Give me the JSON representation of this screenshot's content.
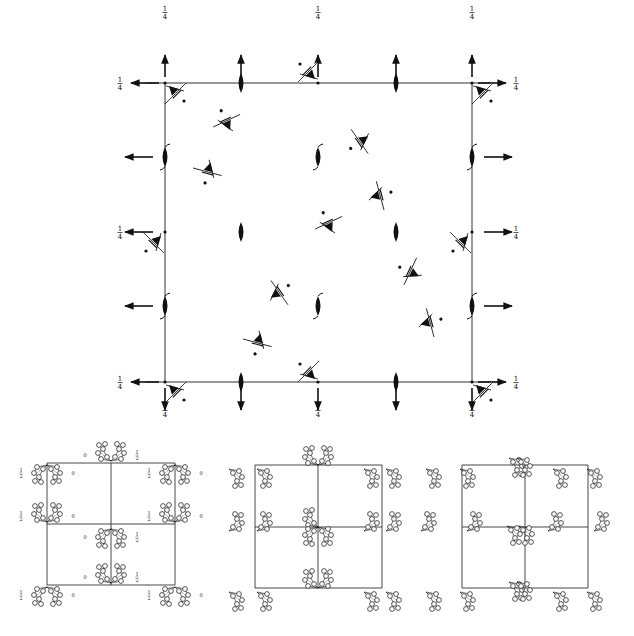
{
  "colors": {
    "ink": "#111111",
    "line": "#333333",
    "background": "#ffffff"
  },
  "main_panel": {
    "cell": {
      "x0": 165,
      "y0": 83,
      "x1": 472,
      "y1": 382,
      "xm": 318,
      "ym": 232
    },
    "fraction_label": "1/4",
    "edge_labels": [
      {
        "id": "top-left",
        "x": 165,
        "y": 12,
        "text": "1/4"
      },
      {
        "id": "top-mid",
        "x": 318,
        "y": 12,
        "text": "1/4"
      },
      {
        "id": "top-right",
        "x": 472,
        "y": 12,
        "text": "1/4"
      },
      {
        "id": "left-top",
        "x": 120,
        "y": 83,
        "text": "1/4"
      },
      {
        "id": "right-top",
        "x": 516,
        "y": 83,
        "text": "1/4"
      },
      {
        "id": "left-mid",
        "x": 120,
        "y": 232,
        "text": "1/4"
      },
      {
        "id": "right-mid",
        "x": 516,
        "y": 232,
        "text": "1/4"
      },
      {
        "id": "left-bottom",
        "x": 120,
        "y": 382,
        "text": "1/4"
      },
      {
        "id": "right-bottom",
        "x": 516,
        "y": 382,
        "text": "1/4"
      },
      {
        "id": "bottom-left",
        "x": 165,
        "y": 410,
        "text": "1/4"
      },
      {
        "id": "bottom-mid",
        "x": 318,
        "y": 410,
        "text": "1/4"
      },
      {
        "id": "bottom-right",
        "x": 472,
        "y": 410,
        "text": "1/4"
      }
    ],
    "twofold_axes": [
      {
        "x": 241,
        "y": 83,
        "kind": "plain"
      },
      {
        "x": 396,
        "y": 83,
        "kind": "plain"
      },
      {
        "x": 241,
        "y": 382,
        "kind": "plain"
      },
      {
        "x": 396,
        "y": 382,
        "kind": "plain"
      },
      {
        "x": 241,
        "y": 232,
        "kind": "plain"
      },
      {
        "x": 396,
        "y": 232,
        "kind": "plain"
      },
      {
        "x": 165,
        "y": 157,
        "kind": "screw"
      },
      {
        "x": 472,
        "y": 157,
        "kind": "screw"
      },
      {
        "x": 165,
        "y": 306,
        "kind": "screw"
      },
      {
        "x": 472,
        "y": 306,
        "kind": "screw"
      },
      {
        "x": 318,
        "y": 157,
        "kind": "screw"
      },
      {
        "x": 318,
        "y": 306,
        "kind": "screw"
      }
    ],
    "arrows": [
      {
        "x": 165,
        "y": 83,
        "dir": "up"
      },
      {
        "x": 165,
        "y": 83,
        "dir": "left"
      },
      {
        "x": 241,
        "y": 83,
        "dir": "up"
      },
      {
        "x": 318,
        "y": 83,
        "dir": "up"
      },
      {
        "x": 396,
        "y": 83,
        "dir": "up"
      },
      {
        "x": 472,
        "y": 83,
        "dir": "up"
      },
      {
        "x": 472,
        "y": 83,
        "dir": "right"
      },
      {
        "x": 165,
        "y": 157,
        "dir": "left"
      },
      {
        "x": 472,
        "y": 157,
        "dir": "right"
      },
      {
        "x": 165,
        "y": 232,
        "dir": "left"
      },
      {
        "x": 472,
        "y": 232,
        "dir": "right"
      },
      {
        "x": 165,
        "y": 306,
        "dir": "left"
      },
      {
        "x": 472,
        "y": 306,
        "dir": "right"
      },
      {
        "x": 165,
        "y": 382,
        "dir": "left"
      },
      {
        "x": 472,
        "y": 382,
        "dir": "right"
      },
      {
        "x": 165,
        "y": 382,
        "dir": "down"
      },
      {
        "x": 241,
        "y": 382,
        "dir": "down"
      },
      {
        "x": 318,
        "y": 382,
        "dir": "down"
      },
      {
        "x": 396,
        "y": 382,
        "dir": "down"
      },
      {
        "x": 472,
        "y": 382,
        "dir": "down"
      }
    ],
    "triads": [
      {
        "x": 176,
        "y": 93,
        "rot": 0
      },
      {
        "x": 483,
        "y": 93,
        "rot": 0
      },
      {
        "x": 308,
        "y": 72,
        "rot": 180
      },
      {
        "x": 176,
        "y": 392,
        "rot": 0
      },
      {
        "x": 483,
        "y": 392,
        "rot": 0
      },
      {
        "x": 308,
        "y": 372,
        "rot": 180
      },
      {
        "x": 154,
        "y": 243,
        "rot": 90
      },
      {
        "x": 461,
        "y": 243,
        "rot": 90
      },
      {
        "x": 226,
        "y": 121,
        "rot": 200
      },
      {
        "x": 208,
        "y": 172,
        "rot": 60
      },
      {
        "x": 360,
        "y": 142,
        "rot": 100
      },
      {
        "x": 380,
        "y": 195,
        "rot": 300
      },
      {
        "x": 328,
        "y": 223,
        "rot": 200
      },
      {
        "x": 410,
        "y": 272,
        "rot": 160
      },
      {
        "x": 279,
        "y": 292,
        "rot": 280
      },
      {
        "x": 258,
        "y": 343,
        "rot": 60
      },
      {
        "x": 430,
        "y": 322,
        "rot": 300
      }
    ]
  },
  "sub_panels": [
    {
      "id": "left",
      "cell": {
        "x0": 47,
        "y0": 463,
        "x1": 175,
        "y1": 585,
        "xm": 111,
        "ym": 524
      },
      "labels": [
        "1/2",
        "0"
      ],
      "clusters": [
        {
          "x": 47,
          "y": 463,
          "pair": true,
          "labelL": "1/2",
          "labelR": "0"
        },
        {
          "x": 111,
          "y": 463,
          "pair": true,
          "labelL": "0",
          "labelR": "1/2",
          "up": true
        },
        {
          "x": 175,
          "y": 463,
          "pair": true,
          "labelL": "1/2",
          "labelR": "0"
        },
        {
          "x": 47,
          "y": 524,
          "pair": true,
          "labelL": "1/2",
          "labelR": "0",
          "up": true
        },
        {
          "x": 111,
          "y": 527,
          "pair": true,
          "labelL": "0",
          "labelR": "1/2"
        },
        {
          "x": 175,
          "y": 524,
          "pair": true,
          "labelL": "1/2",
          "labelR": "0",
          "up": true
        },
        {
          "x": 111,
          "y": 585,
          "pair": true,
          "labelL": "0",
          "labelR": "1/2",
          "up": true
        },
        {
          "x": 47,
          "y": 585,
          "pair": true,
          "labelL": "1/2",
          "labelR": "0"
        },
        {
          "x": 175,
          "y": 585,
          "pair": true,
          "labelL": "1/2",
          "labelR": "0"
        }
      ]
    },
    {
      "id": "middle",
      "cell": {
        "x0": 255,
        "y0": 465,
        "x1": 382,
        "y1": 588,
        "xm": 318,
        "ym": 527
      },
      "clusters": [
        {
          "x": 318,
          "y": 465,
          "kind": "double-up"
        },
        {
          "x": 318,
          "y": 527,
          "kind": "star"
        },
        {
          "x": 318,
          "y": 588,
          "kind": "double-up"
        },
        {
          "x": 236,
          "y": 473,
          "kind": "single"
        },
        {
          "x": 264,
          "y": 473,
          "kind": "single"
        },
        {
          "x": 371,
          "y": 473,
          "kind": "single"
        },
        {
          "x": 393,
          "y": 473,
          "kind": "single"
        },
        {
          "x": 236,
          "y": 519,
          "kind": "single-up"
        },
        {
          "x": 264,
          "y": 519,
          "kind": "single-up"
        },
        {
          "x": 371,
          "y": 519,
          "kind": "single-up"
        },
        {
          "x": 393,
          "y": 519,
          "kind": "single-up"
        },
        {
          "x": 236,
          "y": 596,
          "kind": "single"
        },
        {
          "x": 264,
          "y": 596,
          "kind": "single"
        },
        {
          "x": 371,
          "y": 596,
          "kind": "single"
        },
        {
          "x": 393,
          "y": 596,
          "kind": "single"
        }
      ]
    },
    {
      "id": "right",
      "cell": {
        "x0": 462,
        "y0": 465,
        "x1": 588,
        "y1": 588,
        "xm": 525,
        "ym": 527
      },
      "clusters": [
        {
          "x": 513,
          "y": 458,
          "kind": "stack"
        },
        {
          "x": 513,
          "y": 534,
          "kind": "ring"
        },
        {
          "x": 513,
          "y": 582,
          "kind": "stack"
        },
        {
          "x": 433,
          "y": 473,
          "kind": "single"
        },
        {
          "x": 467,
          "y": 473,
          "kind": "single"
        },
        {
          "x": 560,
          "y": 473,
          "kind": "single"
        },
        {
          "x": 594,
          "y": 473,
          "kind": "single"
        },
        {
          "x": 428,
          "y": 519,
          "kind": "single-up"
        },
        {
          "x": 474,
          "y": 519,
          "kind": "single-up"
        },
        {
          "x": 555,
          "y": 519,
          "kind": "single-up"
        },
        {
          "x": 601,
          "y": 519,
          "kind": "single-up"
        },
        {
          "x": 433,
          "y": 596,
          "kind": "single"
        },
        {
          "x": 467,
          "y": 596,
          "kind": "single"
        },
        {
          "x": 560,
          "y": 596,
          "kind": "single"
        },
        {
          "x": 594,
          "y": 596,
          "kind": "single"
        }
      ]
    }
  ]
}
